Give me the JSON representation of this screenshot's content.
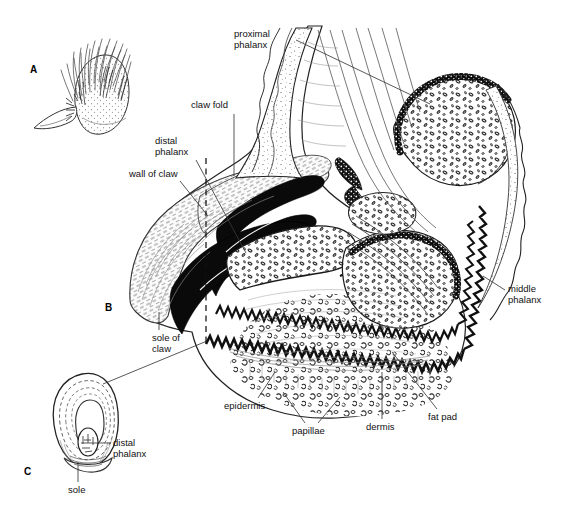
{
  "figure": {
    "background_color": "#ffffff",
    "ink_color": "#000000",
    "label_color": "#111111"
  },
  "panels": [
    {
      "id": "A",
      "label": "A",
      "x": 30,
      "y": 64,
      "description": "external view of haired digit with claw"
    },
    {
      "id": "B",
      "label": "B",
      "x": 105,
      "y": 302,
      "description": "longitudinal (sagittal) section through digit showing claw, phalanges and digital pad"
    },
    {
      "id": "C",
      "label": "C",
      "x": 24,
      "y": 466,
      "description": "transverse section through the claw showing distal phalanx and sole"
    }
  ],
  "labels": [
    {
      "name": "proximal-phalanx",
      "text": "proximal\nphalanx",
      "x": 234,
      "y": 28,
      "align": "left",
      "leader": [
        [
          296,
          40
        ],
        [
          430,
          104
        ]
      ]
    },
    {
      "name": "claw-fold",
      "text": "claw fold",
      "x": 191,
      "y": 99,
      "align": "left",
      "leader": [
        [
          234,
          114
        ],
        [
          234,
          176
        ]
      ]
    },
    {
      "name": "distal-phalanx-b",
      "text": "distal\nphalanx",
      "x": 155,
      "y": 135,
      "align": "left",
      "leader": [
        [
          196,
          160
        ],
        [
          246,
          253
        ]
      ]
    },
    {
      "name": "wall-of-claw",
      "text": "wall of claw",
      "x": 129,
      "y": 168,
      "align": "left",
      "leader": [
        [
          180,
          181
        ],
        [
          208,
          216
        ]
      ]
    },
    {
      "name": "middle-phalanx",
      "text": "middle\nphalanx",
      "x": 508,
      "y": 283,
      "align": "left",
      "leader": [
        [
          505,
          290
        ],
        [
          483,
          276
        ]
      ]
    },
    {
      "name": "sole-of-claw",
      "text": "sole of\nclaw",
      "x": 152,
      "y": 332,
      "align": "left",
      "leader": [
        [
          159,
          330
        ],
        [
          159,
          312
        ]
      ]
    },
    {
      "name": "epidermis",
      "text": "epidermis",
      "x": 224,
      "y": 400,
      "align": "left",
      "leader": [
        [
          258,
          398
        ],
        [
          275,
          372
        ]
      ]
    },
    {
      "name": "papillae",
      "text": "papillae",
      "x": 292,
      "y": 425,
      "align": "left",
      "leader": [
        [
          305,
          423
        ],
        [
          283,
          392
        ]
      ]
    },
    {
      "name": "papillae-leader-2",
      "text": "",
      "x": 0,
      "y": 0,
      "align": "left",
      "leader": [
        [
          318,
          423
        ],
        [
          340,
          397
        ]
      ]
    },
    {
      "name": "dermis",
      "text": "dermis",
      "x": 366,
      "y": 421,
      "align": "left",
      "leader": [
        [
          382,
          419
        ],
        [
          382,
          372
        ]
      ]
    },
    {
      "name": "fat-pad",
      "text": "fat pad",
      "x": 428,
      "y": 411,
      "align": "left",
      "leader": [
        [
          437,
          409
        ],
        [
          392,
          352
        ]
      ]
    },
    {
      "name": "distal-phalanx-c",
      "text": "distal\nphalanx",
      "x": 113,
      "y": 437,
      "align": "left",
      "leader": [
        [
          111,
          443
        ],
        [
          81,
          443
        ]
      ]
    },
    {
      "name": "sole-c",
      "text": "sole",
      "x": 68,
      "y": 484,
      "align": "left",
      "leader": [
        [
          78,
          482
        ],
        [
          78,
          462
        ]
      ]
    }
  ],
  "annotations": {
    "dashed_section_line": {
      "name": "section-plane-line",
      "x": 206,
      "y1": 158,
      "y2": 344
    },
    "panel_c_connector": {
      "name": "panel-c-connector",
      "from": [
        103,
        384
      ],
      "to": [
        207,
        341
      ]
    }
  }
}
